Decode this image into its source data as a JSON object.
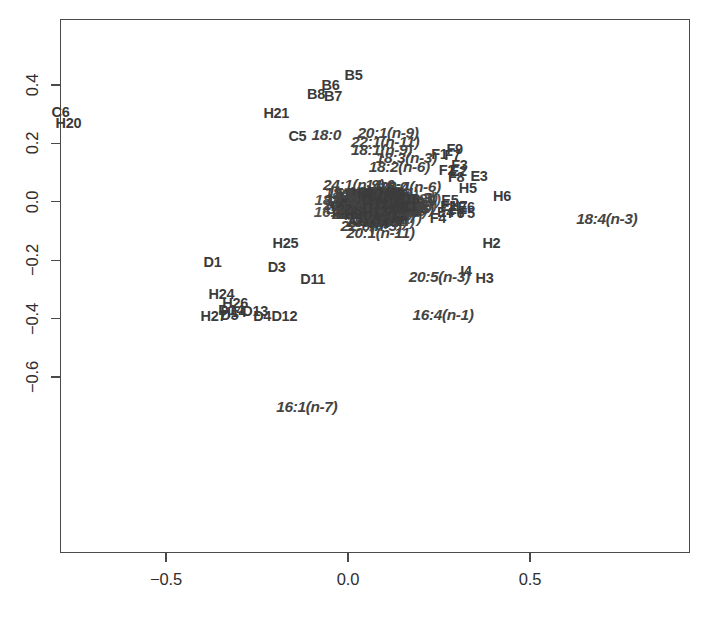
{
  "figure": {
    "kind": "ordination-biplot",
    "background_color": "#ffffff",
    "frame_color": "#4a4a4a",
    "sample_label_color": "#3b3b3b",
    "variable_label_color": "#444444"
  },
  "axes": {
    "x": {
      "ticks": [
        "-0.5",
        "0.0",
        "0.5"
      ],
      "tick_values": [
        -0.5,
        0.0,
        0.5
      ],
      "label": "",
      "range": [
        -0.83,
        0.94
      ]
    },
    "y": {
      "ticks": [
        "0.4",
        "0.2",
        "0.0",
        "-0.2",
        "-0.4",
        "-0.6"
      ],
      "tick_values": [
        0.4,
        0.2,
        0.0,
        -0.2,
        -0.4,
        -0.6
      ],
      "label": "",
      "range": [
        -0.81,
        0.45
      ]
    }
  },
  "chart_data": {
    "type": "scatter",
    "title": "",
    "xlabel": "",
    "ylabel": "",
    "xlim": [
      -0.83,
      0.94
    ],
    "ylim": [
      -0.81,
      0.45
    ],
    "grid": false,
    "legend": "none",
    "xticks": [
      -0.5,
      0.0,
      0.5
    ],
    "yticks": [
      0.4,
      0.2,
      0.0,
      -0.2,
      -0.4,
      -0.6
    ],
    "series": [
      {
        "name": "samples",
        "style": "text-label",
        "italic": false,
        "points": [
          {
            "label": "B5",
            "x": 0.015,
            "y": 0.434
          },
          {
            "label": "B6",
            "x": -0.048,
            "y": 0.4
          },
          {
            "label": "B8",
            "x": -0.088,
            "y": 0.37
          },
          {
            "label": "B7",
            "x": -0.041,
            "y": 0.363
          },
          {
            "label": "C6",
            "x": -0.79,
            "y": 0.307
          },
          {
            "label": "H21",
            "x": -0.197,
            "y": 0.304
          },
          {
            "label": "H20",
            "x": -0.768,
            "y": 0.27
          },
          {
            "label": "C5",
            "x": -0.139,
            "y": 0.227
          },
          {
            "label": "F9",
            "x": 0.293,
            "y": 0.182
          },
          {
            "label": "F1",
            "x": 0.251,
            "y": 0.162
          },
          {
            "label": "F7",
            "x": 0.287,
            "y": 0.159
          },
          {
            "label": "F3",
            "x": 0.306,
            "y": 0.127
          },
          {
            "label": "F2",
            "x": 0.272,
            "y": 0.108
          },
          {
            "label": "E2",
            "x": 0.303,
            "y": 0.104
          },
          {
            "label": "F8",
            "x": 0.297,
            "y": 0.086
          },
          {
            "label": "E3",
            "x": 0.36,
            "y": 0.09
          },
          {
            "label": "H5",
            "x": 0.329,
            "y": 0.046
          },
          {
            "label": "H6",
            "x": 0.423,
            "y": 0.019
          },
          {
            "label": "E5",
            "x": 0.28,
            "y": 0.007
          },
          {
            "label": "E1",
            "x": 0.277,
            "y": -0.015
          },
          {
            "label": "H7",
            "x": 0.303,
            "y": -0.016
          },
          {
            "label": "E6",
            "x": 0.325,
            "y": -0.019
          },
          {
            "label": "E4",
            "x": 0.268,
            "y": -0.036
          },
          {
            "label": "F6",
            "x": 0.297,
            "y": -0.037
          },
          {
            "label": "F5",
            "x": 0.326,
            "y": -0.038
          },
          {
            "label": "F4",
            "x": 0.247,
            "y": -0.055
          },
          {
            "label": "H2",
            "x": 0.394,
            "y": -0.142
          },
          {
            "label": "H25",
            "x": -0.172,
            "y": -0.14
          },
          {
            "label": "D1",
            "x": -0.372,
            "y": -0.205
          },
          {
            "label": "D3",
            "x": -0.196,
            "y": -0.224
          },
          {
            "label": "I4",
            "x": 0.324,
            "y": -0.236
          },
          {
            "label": "H3",
            "x": 0.375,
            "y": -0.261
          },
          {
            "label": "D11",
            "x": -0.097,
            "y": -0.265
          },
          {
            "label": "H24",
            "x": -0.348,
            "y": -0.316
          },
          {
            "label": "H26",
            "x": -0.31,
            "y": -0.348
          },
          {
            "label": "D14",
            "x": -0.321,
            "y": -0.372
          },
          {
            "label": "H14",
            "x": -0.315,
            "y": -0.376
          },
          {
            "label": "D13",
            "x": -0.255,
            "y": -0.373
          },
          {
            "label": "H27",
            "x": -0.37,
            "y": -0.392
          },
          {
            "label": "D5",
            "x": -0.326,
            "y": -0.389
          },
          {
            "label": "D4",
            "x": -0.236,
            "y": -0.39
          },
          {
            "label": "D12",
            "x": -0.175,
            "y": -0.391
          }
        ]
      },
      {
        "name": "fatty-acid variables",
        "style": "text-label",
        "italic": true,
        "points": [
          {
            "label": "18:0",
            "x": -0.06,
            "y": 0.228
          },
          {
            "label": "20:1(n-9)",
            "x": 0.11,
            "y": 0.236
          },
          {
            "label": "22:1(n-11)",
            "x": 0.102,
            "y": 0.205
          },
          {
            "label": "18:1(n-9)",
            "x": 0.092,
            "y": 0.177
          },
          {
            "label": "18:3(n-3)",
            "x": 0.16,
            "y": 0.15
          },
          {
            "label": "18:2(n-6)",
            "x": 0.141,
            "y": 0.118
          },
          {
            "label": "24:1(n-9)",
            "x": 0.015,
            "y": 0.057
          },
          {
            "label": "14:0",
            "x": 0.087,
            "y": 0.057
          },
          {
            "label": "15:0",
            "x": 0.124,
            "y": 0.052
          },
          {
            "label": "20:4(n-6)",
            "x": 0.171,
            "y": 0.05
          },
          {
            "label": "16:0",
            "x": -0.018,
            "y": 0.031
          },
          {
            "label": "22:5(n-6)",
            "x": 0.152,
            "y": -0.023
          },
          {
            "label": "20:1(n-7)",
            "x": 0.118,
            "y": -0.055
          },
          {
            "label": "18:1(n-7)",
            "x": 0.078,
            "y": -0.07
          },
          {
            "label": "22:6(n-3)",
            "x": 0.063,
            "y": -0.082
          },
          {
            "label": "20:1(n-11)",
            "x": 0.089,
            "y": -0.107
          },
          {
            "label": "18:4(n-3)",
            "x": 0.711,
            "y": -0.06
          },
          {
            "label": "20:5(n-3)",
            "x": 0.251,
            "y": -0.259
          },
          {
            "label": "16:4(n-1)",
            "x": 0.261,
            "y": -0.387
          },
          {
            "label": "16:1(n-7)",
            "x": -0.113,
            "y": -0.704
          }
        ]
      }
    ]
  },
  "dense_core": {
    "description": "heavily overprinted central cluster of sample and variable labels",
    "blob_labels": [
      "H8",
      "H9",
      "H10",
      "H11",
      "H12",
      "H13",
      "H15",
      "H16",
      "H17",
      "H18",
      "H19",
      "H22",
      "H23",
      "D2",
      "D6",
      "D7",
      "D8",
      "D9",
      "D10",
      "C1",
      "C2",
      "C3",
      "C4",
      "B1",
      "B2",
      "B3",
      "B4",
      "I1",
      "I2",
      "I3",
      "A1",
      "A2",
      "A3",
      "A4",
      "G1",
      "G2",
      "G3",
      "G4",
      "G5",
      "16:2(n-4)",
      "16:3(n-4)",
      "17:0",
      "20:0",
      "22:0",
      "21:5(n-3)",
      "22:5(n-3)",
      "18:1(n-11)",
      "20:2(n-6)",
      "20:3(n-3)",
      "16:1(n-9)",
      "17:1",
      "24:0",
      "22:1(n-9)"
    ]
  }
}
